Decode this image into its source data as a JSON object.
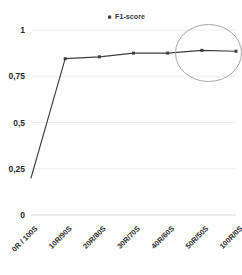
{
  "chart_data": {
    "type": "line",
    "title": "",
    "subtitle": "",
    "xlabel": "",
    "ylabel": "",
    "categories": [
      "0R / 100S",
      "10R/90S",
      "20R/80S",
      "30R/70S",
      "40R/60S",
      "50R/50S",
      "100R/0S"
    ],
    "series": [
      {
        "name": "F1-score",
        "values": [
          0.2,
          0.845,
          0.855,
          0.875,
          0.875,
          0.89,
          0.885
        ],
        "color": "#3f3f3f",
        "marker": "square"
      }
    ],
    "ylim": [
      0,
      1
    ],
    "yticks": [
      0,
      0.25,
      0.5,
      0.75,
      1
    ],
    "ytick_labels": [
      "0",
      "0,25",
      "0,5",
      "0,75",
      "1"
    ],
    "grid": true,
    "grid_axis": "y",
    "grid_color": "#e6e6e6",
    "legend": {
      "entries": [
        "F1-score"
      ],
      "position": "top-center",
      "marker_color": "#3f3f3f"
    },
    "annotations": [
      {
        "type": "ellipse-highlight",
        "label": "highlight-last-points",
        "covers": [
          "50R/50S",
          "100R/0S"
        ],
        "color": "#a9a9a9"
      }
    ],
    "xtick_rotation": -45,
    "background": "#ffffff",
    "axis_color": "#d9d9d9"
  }
}
